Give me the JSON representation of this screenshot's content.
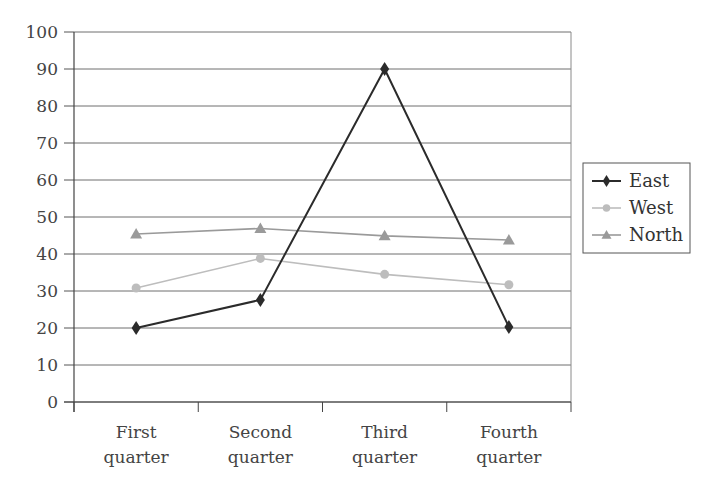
{
  "chart_data": {
    "type": "line",
    "title": "",
    "xlabel": "",
    "ylabel": "",
    "categories": [
      "First quarter",
      "Second quarter",
      "Third quarter",
      "Fourth quarter"
    ],
    "category_lines": [
      [
        "First",
        "quarter"
      ],
      [
        "Second",
        "quarter"
      ],
      [
        "Third",
        "quarter"
      ],
      [
        "Fourth",
        "quarter"
      ]
    ],
    "ylim": [
      0,
      100
    ],
    "yticks": [
      0,
      10,
      20,
      30,
      40,
      50,
      60,
      70,
      80,
      90,
      100
    ],
    "grid": true,
    "legend_position": "right",
    "series": [
      {
        "name": "East",
        "values": [
          20,
          27.6,
          90,
          20.3
        ],
        "color": "#2b2b2b",
        "marker": "diamond"
      },
      {
        "name": "West",
        "values": [
          30.8,
          38.8,
          34.5,
          31.7
        ],
        "color": "#bdbdbd",
        "marker": "circle"
      },
      {
        "name": "North",
        "values": [
          45.4,
          46.9,
          44.9,
          43.8
        ],
        "color": "#9a9a9a",
        "marker": "triangle"
      }
    ]
  }
}
